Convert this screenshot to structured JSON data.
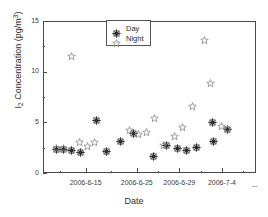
{
  "chart_data": {
    "type": "scatter",
    "title": "",
    "xlabel": "Date",
    "ylabel": "I2 Concentration (pg/m3)",
    "ylabel_parts": {
      "base": "I",
      "sub": "2",
      "mid": " Concentration (pg/m",
      "sup": "3",
      "tail": ")"
    },
    "ylim": [
      0,
      15
    ],
    "yticks": [
      0,
      5,
      10,
      15
    ],
    "ytick_labels": [
      "0",
      "5",
      "10",
      "15"
    ],
    "yminor_ticks": [
      2.5,
      7.5,
      12.5
    ],
    "grid": false,
    "legend_position": "top-center",
    "x_axis_type": "date-category",
    "xtick_labels": [
      "2006-6-15",
      "2006-6-25",
      "2006-6-29",
      "2006-7-4"
    ],
    "xtick_positions": [
      5.0,
      11.0,
      16.0,
      21.0
    ],
    "xminor_tick_positions": [
      2.0,
      8.0,
      13.5,
      18.5,
      23.5
    ],
    "xlim": [
      0,
      25
    ],
    "axis_end_marker": "--",
    "series": [
      {
        "name": "Day",
        "marker": "filled-star-square",
        "color": "#2b2b2b",
        "points": [
          {
            "x": 1.55,
            "y": 2.35
          },
          {
            "x": 2.45,
            "y": 2.35
          },
          {
            "x": 3.35,
            "y": 2.25
          },
          {
            "x": 4.35,
            "y": 2.05
          },
          {
            "x": 6.25,
            "y": 5.15
          },
          {
            "x": 7.45,
            "y": 2.15
          },
          {
            "x": 9.05,
            "y": 3.15
          },
          {
            "x": 10.6,
            "y": 3.85
          },
          {
            "x": 13.0,
            "y": 1.65
          },
          {
            "x": 14.5,
            "y": 2.75
          },
          {
            "x": 15.8,
            "y": 2.45
          },
          {
            "x": 16.8,
            "y": 2.25
          },
          {
            "x": 18.0,
            "y": 2.55
          },
          {
            "x": 19.9,
            "y": 4.95
          },
          {
            "x": 20.0,
            "y": 3.15
          },
          {
            "x": 21.6,
            "y": 4.3
          }
        ]
      },
      {
        "name": "Night",
        "marker": "open-star",
        "color": "#8a8a8a",
        "points": [
          {
            "x": 1.55,
            "y": 2.4
          },
          {
            "x": 2.45,
            "y": 2.4
          },
          {
            "x": 3.3,
            "y": 11.5
          },
          {
            "x": 4.3,
            "y": 3.0
          },
          {
            "x": 5.2,
            "y": 2.65
          },
          {
            "x": 6.1,
            "y": 3.0
          },
          {
            "x": 10.2,
            "y": 4.2
          },
          {
            "x": 11.2,
            "y": 3.8
          },
          {
            "x": 12.1,
            "y": 3.95
          },
          {
            "x": 13.1,
            "y": 5.35
          },
          {
            "x": 14.1,
            "y": 2.75
          },
          {
            "x": 15.4,
            "y": 3.6
          },
          {
            "x": 16.4,
            "y": 4.45
          },
          {
            "x": 17.6,
            "y": 6.55
          },
          {
            "x": 18.9,
            "y": 13.05
          },
          {
            "x": 19.7,
            "y": 8.85
          },
          {
            "x": 20.9,
            "y": 4.6
          },
          {
            "x": 21.7,
            "y": 4.3
          }
        ]
      }
    ],
    "legend": [
      {
        "label": "Day",
        "marker": "filled-star-square"
      },
      {
        "label": "Night",
        "marker": "open-star"
      }
    ]
  },
  "axis": {
    "frame_color": "#4a4a4a",
    "text_color": "#2e2e2e"
  }
}
